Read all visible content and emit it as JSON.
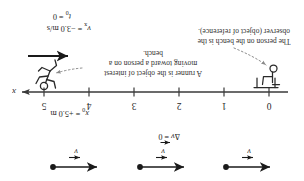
{
  "figure": {
    "orientation": "rotated-180",
    "colors": {
      "ink": "#262626",
      "axis": "#3a3a3a",
      "vector": "#1a1a1a",
      "leader": "#7d7d7d",
      "background": "#ffffff"
    }
  },
  "axis": {
    "label": "x",
    "tick_labels": [
      "0",
      "1",
      "2",
      "3",
      "4",
      "5"
    ],
    "tick_values": [
      0,
      1,
      2,
      3,
      4,
      5
    ],
    "units": "m",
    "direction": "right"
  },
  "initial_conditions": {
    "position_label": "x",
    "position_sub": "0",
    "position_text": "= +5.0 m",
    "position_full": "x0 = +5.0 m",
    "time_label": "t",
    "time_sub": "0",
    "time_text": "= 0",
    "time_full": "t0 = 0",
    "velocity_label": "v",
    "velocity_sub": "x",
    "velocity_text": "= −3.0 m/s",
    "velocity_full": "vx = −3.0 m/s"
  },
  "captions": {
    "observer": "The person on the bench is the observer (object of reference).",
    "runner": "A runner is the object of interest moving toward a person on a bench."
  },
  "vector_diagram": {
    "delta_label": "Δ",
    "v_glyph": "v",
    "delta_text": "= 0",
    "delta_full": "Δv = 0",
    "arrows": [
      {
        "name": "velocity-vector-1",
        "glyph": "v",
        "direction": "left"
      },
      {
        "name": "velocity-vector-2",
        "glyph": "v",
        "direction": "left"
      },
      {
        "name": "velocity-vector-3",
        "glyph": "v",
        "direction": "left"
      }
    ]
  },
  "figures": {
    "bench_person": "person-on-bench",
    "runner": "running-person"
  }
}
